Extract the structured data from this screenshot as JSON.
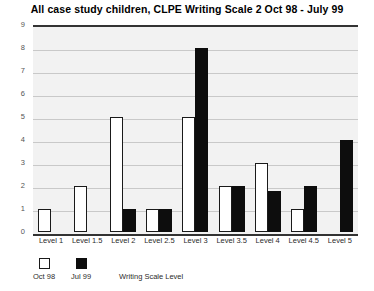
{
  "chart_data": {
    "type": "bar",
    "title": "All case study children, CLPE Writing Scale 2 Oct 98 - July 99",
    "xlabel": "Writing Scale Level",
    "ylabel": "",
    "ylim": [
      0,
      9
    ],
    "yticks": [
      0,
      1,
      2,
      3,
      4,
      5,
      6,
      7,
      8,
      9
    ],
    "grid": true,
    "legend_position": "bottom-left",
    "categories": [
      "Level 1",
      "Level 1.5",
      "Level 2",
      "Level 2.5",
      "Level 3",
      "Level 3.5",
      "Level 4",
      "Level 4.5",
      "Level 5"
    ],
    "series": [
      {
        "name": "Oct 98",
        "color": "#ffffff",
        "values": [
          1,
          2,
          5,
          1,
          5,
          2,
          3,
          1,
          0
        ]
      },
      {
        "name": "Jul 99",
        "color": "#0d0d0d",
        "values": [
          0,
          0,
          1,
          1,
          8,
          2,
          1.8,
          2,
          4
        ]
      }
    ]
  },
  "legend": {
    "entries": [
      {
        "label": "Oct 98",
        "swatch": "white-square-swatch"
      },
      {
        "label": "Jul 99",
        "swatch": "black-square-swatch"
      }
    ]
  }
}
